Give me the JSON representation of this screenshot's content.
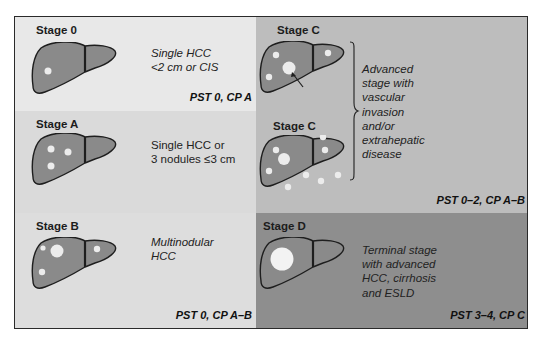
{
  "diagram": {
    "colors": {
      "frame_border": "#2a2a2a",
      "stage0_bg": "#e8e8e8",
      "stageA_bg": "#dadada",
      "stageB_bg": "#dddddd",
      "stageC_bg": "#bdbdbd",
      "stageD_bg": "#8e8e8e",
      "liver_fill": "#8a8a8a",
      "nodule_fill": "#f2f2f2"
    },
    "stages": [
      {
        "id": "stage-0",
        "title": "Stage 0",
        "description_lines": [
          "Single HCC",
          "<2 cm or CIS"
        ],
        "criteria": "PST 0, CP A",
        "nodules": "single small"
      },
      {
        "id": "stage-a",
        "title": "Stage A",
        "description_lines": [
          "Single HCC or",
          "3 nodules ≤3 cm"
        ],
        "criteria": "",
        "nodules": "three small"
      },
      {
        "id": "stage-b",
        "title": "Stage B",
        "description_lines": [
          "Multinodular",
          "HCC"
        ],
        "criteria": "PST 0, CP A–B",
        "nodules": "multinodular"
      },
      {
        "id": "stage-c1",
        "title": "Stage C",
        "nodules": "vascular invasion (arrow)"
      },
      {
        "id": "stage-c2",
        "title": "Stage C",
        "nodules": "extrahepatic spread"
      },
      {
        "id": "stage-d",
        "title": "Stage D",
        "description_lines": [
          "Terminal stage",
          "with advanced",
          "HCC, cirrhosis",
          "and ESLD"
        ],
        "criteria": "PST 3–4, CP C",
        "nodules": "single large"
      }
    ],
    "stage_c_description_lines": [
      "Advanced",
      "stage with",
      "vascular",
      "invasion",
      "and/or",
      "extrahepatic",
      "disease"
    ],
    "stage_c_criteria": "PST 0–2, CP A–B"
  }
}
